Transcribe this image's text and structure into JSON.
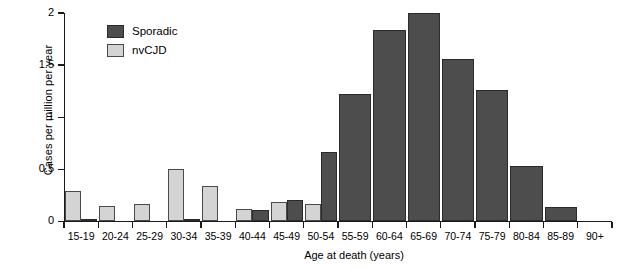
{
  "chart_data": {
    "type": "bar",
    "title": "",
    "xlabel": "Age at death (years)",
    "ylabel": "Cases per million per year",
    "categories": [
      "15-19",
      "20-24",
      "25-29",
      "30-34",
      "35-39",
      "40-44",
      "45-49",
      "50-54",
      "55-59",
      "60-64",
      "65-69",
      "70-74",
      "75-79",
      "80-84",
      "85-89",
      "90+"
    ],
    "series": [
      {
        "name": "Sporadic",
        "color": "#4d4d4d",
        "values": [
          0.02,
          0.0,
          0.0,
          0.02,
          0.0,
          0.11,
          0.21,
          0.67,
          1.22,
          1.84,
          2.0,
          1.56,
          1.26,
          0.53,
          0.14,
          0.0
        ]
      },
      {
        "name": "nvCJD",
        "color": "#d4d4d4",
        "values": [
          0.29,
          0.15,
          0.17,
          0.5,
          0.34,
          0.12,
          0.19,
          0.17,
          0.0,
          0.0,
          0.0,
          0.0,
          0.0,
          0.0,
          0.0,
          0.0
        ]
      }
    ],
    "ylim": [
      0,
      2
    ],
    "yticks": [
      0,
      0.5,
      1,
      1.5,
      2
    ],
    "ytick_labels": [
      "0",
      "0.5",
      "1",
      "1.5",
      "2"
    ],
    "grid": false,
    "legend_position": "top-left"
  },
  "legend": {
    "items": [
      {
        "label": "Sporadic",
        "swatch": "sporadic-swatch"
      },
      {
        "label": "nvCJD",
        "swatch": "nvcjd-swatch"
      }
    ]
  }
}
